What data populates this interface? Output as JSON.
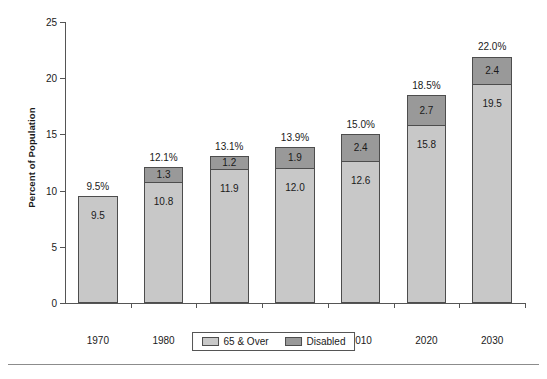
{
  "chart_data": {
    "type": "bar",
    "subtype": "stacked-bar",
    "title": "",
    "xlabel": "",
    "ylabel": "Percent of Population",
    "ylim": [
      0,
      25
    ],
    "yticks": [
      0,
      5,
      10,
      15,
      20,
      25
    ],
    "grid": false,
    "legend_position": "bottom-center",
    "categories": [
      "1970",
      "1980",
      "1990",
      "2000",
      "2010",
      "2020",
      "2030"
    ],
    "series": [
      {
        "name": "65 & Over",
        "color": "#c8c8c8",
        "values": [
          9.5,
          10.8,
          11.9,
          12.0,
          12.6,
          15.8,
          19.5
        ],
        "labels": [
          "9.5",
          "10.8",
          "11.9",
          "12.0",
          "12.6",
          "15.8",
          "19.5"
        ]
      },
      {
        "name": "Disabled",
        "color": "#999999",
        "values": [
          0,
          1.3,
          1.2,
          1.9,
          2.4,
          2.7,
          2.4
        ],
        "labels": [
          "",
          "1.3",
          "1.2",
          "1.9",
          "2.4",
          "2.7",
          "2.4"
        ]
      }
    ],
    "totals": [
      9.5,
      12.1,
      13.1,
      13.9,
      15.0,
      18.5,
      22.0
    ],
    "total_labels": [
      "9.5%",
      "12.1%",
      "13.1%",
      "13.9%",
      "15.0%",
      "18.5%",
      "22.0%"
    ]
  },
  "axes": {
    "y_title": "Percent of Population",
    "y_tick_labels": [
      "0",
      "5",
      "10",
      "15",
      "20",
      "25"
    ],
    "x_tick_labels": [
      "1970",
      "1980",
      "1990",
      "2000",
      "2010",
      "2020",
      "2030"
    ]
  },
  "legend": {
    "entries": [
      {
        "label": "65 & Over",
        "color": "#c8c8c8"
      },
      {
        "label": "Disabled",
        "color": "#999999"
      }
    ]
  },
  "colors": {
    "series_65_over": "#c8c8c8",
    "series_disabled": "#999999",
    "axis": "#555555",
    "bar_outline": "#4d4d4d",
    "background": "#ffffff"
  }
}
